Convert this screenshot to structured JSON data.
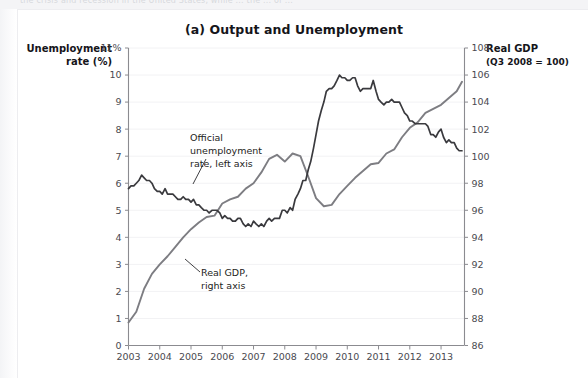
{
  "page": {
    "top_strip_text": "the crisis and recession in the United States, while ... the ... of ...",
    "background_color": "#ffffff"
  },
  "figure": {
    "title": "(a) Output and Unemployment",
    "left_axis_title_line1": "Unemployment",
    "left_axis_title_line2": "rate (%)",
    "right_axis_title_line1": "Real GDP",
    "right_axis_title_line2": "(Q3 2008 = 100)"
  },
  "annotations": [
    {
      "name": "unemployment-annotation",
      "line1": "Official",
      "line2": "unemployment",
      "line3": "rate, left axis"
    },
    {
      "name": "gdp-annotation",
      "line1": "Real GDP,",
      "line2": "right axis"
    }
  ],
  "colors": {
    "unemployment_line": "#3a3a3e",
    "gdp_line": "#7d7d82",
    "axis": "#8b8b90",
    "gridline": "#f2f2f4",
    "tick_label": "#4a4a50",
    "title": "#15151a"
  },
  "chart_data": {
    "type": "line",
    "title": "(a) Output and Unemployment",
    "xlabel": "",
    "ylabel": "Unemployment rate (%)",
    "y2label": "Real GDP (Q3 2008 = 100)",
    "grid": true,
    "legend": "annotations-inline",
    "xlim": [
      2003.0,
      2013.75
    ],
    "xticks": [
      "2003",
      "2004",
      "2005",
      "2006",
      "2007",
      "2008",
      "2009",
      "2010",
      "2011",
      "2012",
      "2013"
    ],
    "ylim": [
      0,
      11
    ],
    "yticks": [
      "0",
      "1",
      "2",
      "3",
      "4",
      "5",
      "6",
      "7",
      "8",
      "9",
      "10",
      "11%"
    ],
    "y2lim": [
      86,
      108
    ],
    "y2ticks": [
      "86",
      "88",
      "90",
      "92",
      "94",
      "96",
      "98",
      "100",
      "102",
      "104",
      "106",
      "108"
    ],
    "series": [
      {
        "name": "Official unemployment rate, left axis",
        "axis": "left",
        "units": "percent",
        "color": "#3a3a3e",
        "x": [
          2003.0,
          2003.08,
          2003.17,
          2003.25,
          2003.33,
          2003.42,
          2003.5,
          2003.58,
          2003.67,
          2003.75,
          2003.83,
          2003.92,
          2004.0,
          2004.08,
          2004.17,
          2004.25,
          2004.33,
          2004.42,
          2004.5,
          2004.58,
          2004.67,
          2004.75,
          2004.83,
          2004.92,
          2005.0,
          2005.08,
          2005.17,
          2005.25,
          2005.33,
          2005.42,
          2005.5,
          2005.58,
          2005.67,
          2005.75,
          2005.83,
          2005.92,
          2006.0,
          2006.08,
          2006.17,
          2006.25,
          2006.33,
          2006.42,
          2006.5,
          2006.58,
          2006.67,
          2006.75,
          2006.83,
          2006.92,
          2007.0,
          2007.08,
          2007.17,
          2007.25,
          2007.33,
          2007.42,
          2007.5,
          2007.58,
          2007.67,
          2007.75,
          2007.83,
          2007.92,
          2008.0,
          2008.08,
          2008.17,
          2008.25,
          2008.33,
          2008.42,
          2008.5,
          2008.58,
          2008.67,
          2008.75,
          2008.83,
          2008.92,
          2009.0,
          2009.08,
          2009.17,
          2009.25,
          2009.33,
          2009.42,
          2009.5,
          2009.58,
          2009.67,
          2009.75,
          2009.83,
          2009.92,
          2010.0,
          2010.08,
          2010.17,
          2010.25,
          2010.33,
          2010.42,
          2010.5,
          2010.58,
          2010.67,
          2010.75,
          2010.83,
          2010.92,
          2011.0,
          2011.08,
          2011.17,
          2011.25,
          2011.33,
          2011.42,
          2011.5,
          2011.58,
          2011.67,
          2011.75,
          2011.83,
          2011.92,
          2012.0,
          2012.08,
          2012.17,
          2012.25,
          2012.33,
          2012.42,
          2012.5,
          2012.58,
          2012.67,
          2012.75,
          2012.83,
          2012.92,
          2013.0,
          2013.08,
          2013.17,
          2013.25,
          2013.33,
          2013.42,
          2013.5,
          2013.58,
          2013.67
        ],
        "values": [
          5.8,
          5.9,
          5.9,
          6.0,
          6.1,
          6.3,
          6.2,
          6.1,
          6.1,
          6.0,
          5.8,
          5.7,
          5.7,
          5.6,
          5.8,
          5.6,
          5.6,
          5.6,
          5.5,
          5.4,
          5.4,
          5.5,
          5.4,
          5.4,
          5.3,
          5.4,
          5.2,
          5.2,
          5.1,
          5.0,
          5.0,
          4.9,
          5.0,
          5.0,
          5.0,
          4.9,
          4.7,
          4.8,
          4.7,
          4.7,
          4.6,
          4.6,
          4.7,
          4.7,
          4.5,
          4.4,
          4.5,
          4.4,
          4.6,
          4.5,
          4.4,
          4.5,
          4.4,
          4.6,
          4.7,
          4.6,
          4.7,
          4.7,
          4.7,
          5.0,
          5.0,
          4.9,
          5.1,
          5.0,
          5.4,
          5.6,
          5.8,
          6.1,
          6.1,
          6.5,
          6.8,
          7.3,
          7.8,
          8.3,
          8.7,
          9.0,
          9.4,
          9.5,
          9.5,
          9.6,
          9.8,
          10.0,
          9.9,
          9.9,
          9.8,
          9.8,
          9.9,
          9.9,
          9.6,
          9.4,
          9.5,
          9.5,
          9.5,
          9.5,
          9.8,
          9.4,
          9.1,
          9.0,
          8.9,
          9.0,
          9.0,
          9.1,
          9.0,
          9.0,
          9.0,
          8.8,
          8.6,
          8.5,
          8.3,
          8.3,
          8.2,
          8.2,
          8.2,
          8.2,
          8.2,
          8.1,
          7.8,
          7.8,
          7.7,
          7.9,
          8.0,
          7.7,
          7.5,
          7.6,
          7.5,
          7.5,
          7.3,
          7.2,
          7.2
        ]
      },
      {
        "name": "Real GDP, right axis",
        "axis": "right",
        "units": "index, Q3 2008 = 100",
        "color": "#7d7d82",
        "x": [
          2003.0,
          2003.25,
          2003.5,
          2003.75,
          2004.0,
          2004.25,
          2004.5,
          2004.75,
          2005.0,
          2005.25,
          2005.5,
          2005.75,
          2006.0,
          2006.25,
          2006.5,
          2006.75,
          2007.0,
          2007.25,
          2007.5,
          2007.75,
          2008.0,
          2008.25,
          2008.5,
          2008.75,
          2009.0,
          2009.25,
          2009.5,
          2009.75,
          2010.0,
          2010.25,
          2010.5,
          2010.75,
          2011.0,
          2011.25,
          2011.5,
          2011.75,
          2012.0,
          2012.25,
          2012.5,
          2012.75,
          2013.0,
          2013.25,
          2013.5,
          2013.67
        ],
        "values": [
          87.7,
          88.5,
          90.2,
          91.3,
          92.0,
          92.6,
          93.3,
          94.0,
          94.6,
          95.1,
          95.5,
          95.6,
          96.5,
          96.8,
          97.0,
          97.6,
          98.0,
          98.8,
          99.8,
          100.1,
          99.6,
          100.2,
          100.0,
          98.5,
          96.9,
          96.3,
          96.4,
          97.2,
          97.8,
          98.4,
          98.9,
          99.4,
          99.5,
          100.2,
          100.5,
          101.4,
          102.1,
          102.5,
          103.2,
          103.5,
          103.8,
          104.3,
          104.8,
          105.5
        ]
      }
    ]
  }
}
